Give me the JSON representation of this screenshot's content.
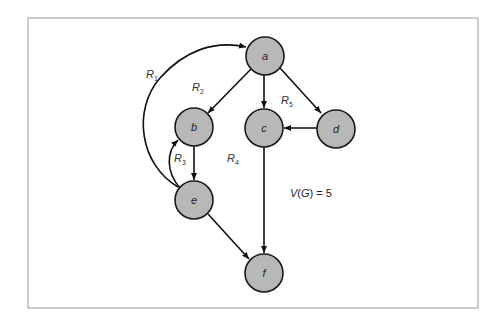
{
  "figure": {
    "frame": {
      "x": 28,
      "y": 18,
      "width": 450,
      "height": 290
    },
    "colors": {
      "node_fill": "#b8b8b8",
      "node_stroke": "#1a1a1a",
      "edge": "#111111",
      "frame": "#9a9a9a",
      "background": "#ffffff"
    },
    "node_radius": 19
  },
  "nodes": [
    {
      "id": "a",
      "label": "a",
      "x": 265,
      "y": 56
    },
    {
      "id": "b",
      "label": "b",
      "x": 194,
      "y": 127
    },
    {
      "id": "c",
      "label": "c",
      "x": 264,
      "y": 128
    },
    {
      "id": "d",
      "label": "d",
      "x": 336,
      "y": 129
    },
    {
      "id": "e",
      "label": "e",
      "x": 194,
      "y": 200
    },
    {
      "id": "f",
      "label": "f",
      "x": 264,
      "y": 273
    }
  ],
  "edges": [
    {
      "from": "a",
      "to": "b",
      "type": "straight"
    },
    {
      "from": "a",
      "to": "c",
      "type": "straight"
    },
    {
      "from": "a",
      "to": "d",
      "type": "straight"
    },
    {
      "from": "d",
      "to": "c",
      "type": "straight"
    },
    {
      "from": "b",
      "to": "e",
      "type": "straight"
    },
    {
      "from": "e",
      "to": "b",
      "type": "curved"
    },
    {
      "from": "e",
      "to": "a",
      "type": "curved"
    },
    {
      "from": "c",
      "to": "f",
      "type": "straight"
    },
    {
      "from": "e",
      "to": "f",
      "type": "straight"
    }
  ],
  "regions": [
    {
      "main": "R",
      "sub": "1",
      "x": 146,
      "y": 78
    },
    {
      "main": "R",
      "sub": "2",
      "x": 192,
      "y": 91
    },
    {
      "main": "R",
      "sub": "3",
      "x": 174,
      "y": 162
    },
    {
      "main": "R",
      "sub": "4",
      "x": 227,
      "y": 162
    },
    {
      "main": "R",
      "sub": "5",
      "x": 281,
      "y": 104
    }
  ],
  "formula": {
    "v": "V",
    "open": "(",
    "g": "G",
    "close": ")",
    "rest": " = 5",
    "x": 290,
    "y": 197
  }
}
